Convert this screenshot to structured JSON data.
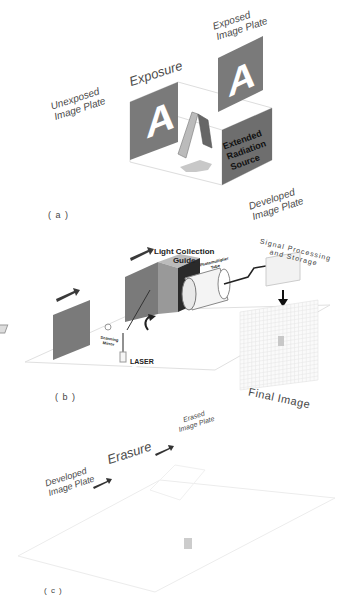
{
  "figure": {
    "panels": [
      {
        "id": "a",
        "label": "( a )",
        "title": "Exposure",
        "left_label": [
          "Unexposed",
          "Image Plate"
        ],
        "right_label": [
          "Exposed",
          "Image Plate"
        ],
        "source_label": [
          "Extended",
          "Radiation",
          "Source"
        ],
        "plate_letter": "A"
      },
      {
        "id": "b",
        "label": "( b )",
        "top_right_label": [
          "Developed",
          "Image Plate"
        ],
        "light_guide_label": [
          "Light Collection",
          "Guide"
        ],
        "pmt_label": [
          "Photomultiplier",
          "Tube"
        ],
        "signal_label": [
          "Signal Processing",
          "and Storage"
        ],
        "mirror_label": [
          "Scanning",
          "Mirror"
        ],
        "laser_label": "LASER",
        "output_label": "Final Image",
        "plate_letter": "A"
      },
      {
        "id": "c",
        "label": "( c )",
        "title": "Erasure",
        "left_label": [
          "Developed",
          "Image Plate"
        ],
        "right_label": [
          "Erased",
          "Image Plate"
        ]
      }
    ],
    "colors": {
      "plate_gray": "#7a7a7a",
      "source_gray": "#6e6e6e",
      "box_dark": "#2a2a2a",
      "arrow": "#3a3a3a",
      "outline": "#d8d8d8"
    }
  }
}
